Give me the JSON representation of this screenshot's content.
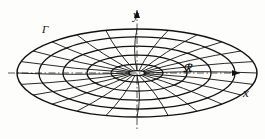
{
  "figure": {
    "background_color": "#fdfdfc",
    "ink_color": "#111111",
    "axis_color": "#555555"
  },
  "axes": {
    "x_label": "x",
    "y_label": "y",
    "origin": {
      "x": 137,
      "y": 73
    },
    "x_axis": {
      "x_start": 8,
      "x_end": 240,
      "y": 73,
      "arrow": "right"
    },
    "y_axis": {
      "y_start": 10,
      "y_end": 130,
      "x": 137,
      "arrow": "up"
    },
    "style": "dash-dot"
  },
  "labels": [
    {
      "name": "boundary-curve-label",
      "text": "Г",
      "x": 42,
      "y": 24
    },
    {
      "name": "region-label",
      "text": "ℛ",
      "x": 183,
      "y": 63
    },
    {
      "name": "y-axis-label",
      "text": "y",
      "x": 133,
      "y": 8
    },
    {
      "name": "x-axis-label",
      "text": "x",
      "x": 243,
      "y": 86
    }
  ],
  "chart_data": {
    "type": "diagram",
    "center": {
      "cx": 137,
      "cy": 73
    },
    "ellipse_count": 6,
    "radial_count": 24,
    "ellipses": [
      {
        "index": 1,
        "rx": 8,
        "ry": 2.5
      },
      {
        "index": 2,
        "rx": 26,
        "ry": 9
      },
      {
        "index": 3,
        "rx": 50,
        "ry": 18
      },
      {
        "index": 4,
        "rx": 74,
        "ry": 27
      },
      {
        "index": 5,
        "rx": 98,
        "ry": 36
      },
      {
        "index": 6,
        "rx": 120,
        "ry": 44
      }
    ],
    "radial_angles_deg": [
      0,
      15,
      30,
      45,
      60,
      75,
      90,
      105,
      120,
      135,
      150,
      165,
      180,
      195,
      210,
      225,
      240,
      255,
      270,
      285,
      300,
      315,
      330,
      345
    ],
    "outer_bounds": {
      "left": 17,
      "right": 257,
      "top": 29,
      "bottom": 117
    }
  }
}
